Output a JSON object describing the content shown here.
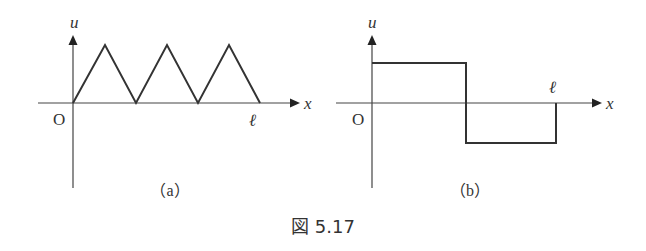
{
  "figure": {
    "caption": "図 5.17",
    "colors": {
      "line": "#333333",
      "axis": "#444444",
      "text": "#333333"
    }
  },
  "panel_a": {
    "label": "（a）",
    "y_axis_label": "u",
    "x_axis_label": "x",
    "origin_label": "O",
    "end_label": "ℓ",
    "description": "Triangular wave: three triangle pulses from x=0 to x=ℓ"
  },
  "panel_b": {
    "label": "（b）",
    "y_axis_label": "u",
    "x_axis_label": "x",
    "origin_label": "O",
    "end_label": "ℓ",
    "description": "Square wave: positive constant on [0, ℓ/2], negative constant on [ℓ/2, ℓ]"
  }
}
